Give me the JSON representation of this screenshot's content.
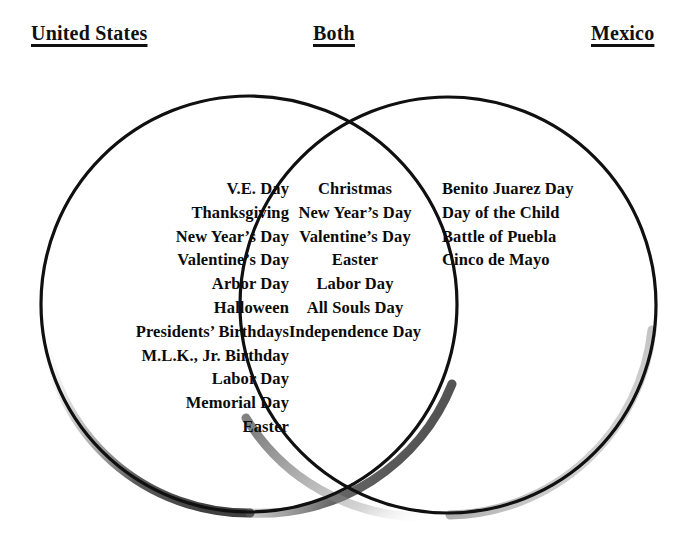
{
  "diagram": {
    "type": "venn",
    "title": "",
    "headers": {
      "left": "United States",
      "middle": "Both",
      "right": "Mexico"
    },
    "sets": {
      "left_only": [
        "V.E. Day",
        "Thanksgiving",
        "New Year’s Day",
        "Valentine’s Day",
        "Arbor Day",
        "Halloween",
        "Presidents’ Birthdays",
        "M.L.K., Jr. Birthday",
        "Labor Day",
        "Memorial Day",
        "Easter"
      ],
      "intersection": [
        "Christmas",
        "New Year’s Day",
        "Valentine’s Day",
        "Easter",
        "Labor Day",
        "All Souls Day",
        "Independence Day"
      ],
      "right_only": [
        "Benito Juarez Day",
        "Day of the Child",
        "Battle of Puebla",
        "Cinco de Mayo"
      ]
    },
    "colors": {
      "stroke": "#101010",
      "text": "#0b0b0b",
      "background": "#ffffff",
      "shadow": "#8d8d8d"
    }
  }
}
